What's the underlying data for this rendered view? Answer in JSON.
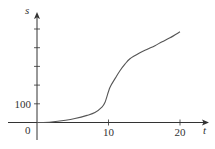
{
  "chart_data": {
    "type": "line",
    "title": "",
    "xlabel": "t",
    "ylabel": "s",
    "xlim": [
      0,
      20
    ],
    "ylim": [
      0,
      500
    ],
    "x_ticks": [
      10,
      20
    ],
    "x_tick_labels": [
      "10",
      "20"
    ],
    "y_ticks": [
      100,
      200,
      300,
      400,
      500
    ],
    "y_tick_labels": [
      "100",
      "",
      "",
      "",
      ""
    ],
    "origin_label": "0",
    "grid": false,
    "legend": null,
    "series": [
      {
        "name": "s(t)",
        "x": [
          0,
          2,
          4,
          5.3,
          7,
          8.1,
          9,
          9.5,
          10.2,
          11,
          11.6,
          12.3,
          13,
          14.4,
          15.5,
          16.5,
          17.5,
          18.6,
          20
        ],
        "y": [
          0,
          3,
          12,
          21,
          38,
          53,
          80,
          107,
          187,
          240,
          277,
          312,
          341,
          373,
          393,
          411,
          432,
          453,
          485
        ]
      }
    ],
    "colors": {
      "axis": "#333333",
      "curve": "#555555"
    }
  }
}
